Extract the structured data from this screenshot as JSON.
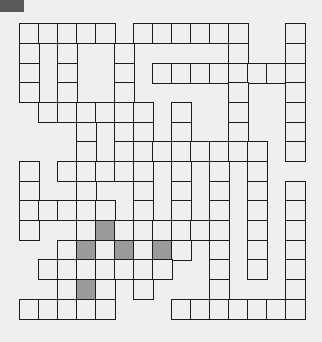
{
  "puzzle": {
    "type": "crossword",
    "rows": 15,
    "cols": 15,
    "legend": {
      "0": "black",
      "1": "white",
      "2": "shaded"
    },
    "colors": {
      "background": "#efefed",
      "line": "#1c1c1c",
      "shaded": "#9a9a9a",
      "corner": "#5a5a5a"
    },
    "grid": [
      [
        1,
        1,
        1,
        1,
        1,
        0,
        1,
        1,
        1,
        1,
        1,
        1,
        0,
        0,
        1
      ],
      [
        1,
        0,
        1,
        0,
        0,
        1,
        0,
        0,
        0,
        0,
        0,
        1,
        0,
        0,
        1
      ],
      [
        1,
        0,
        1,
        0,
        0,
        1,
        0,
        1,
        1,
        1,
        1,
        1,
        1,
        1,
        1
      ],
      [
        1,
        0,
        1,
        0,
        0,
        1,
        0,
        0,
        0,
        0,
        0,
        1,
        0,
        0,
        1
      ],
      [
        0,
        1,
        1,
        1,
        1,
        1,
        1,
        0,
        1,
        0,
        0,
        1,
        0,
        0,
        1
      ],
      [
        0,
        0,
        0,
        1,
        0,
        1,
        1,
        0,
        1,
        0,
        0,
        1,
        0,
        0,
        1
      ],
      [
        0,
        0,
        0,
        1,
        0,
        1,
        1,
        1,
        1,
        1,
        1,
        1,
        1,
        0,
        1
      ],
      [
        1,
        0,
        1,
        1,
        1,
        1,
        1,
        0,
        1,
        0,
        1,
        0,
        1,
        0,
        0
      ],
      [
        1,
        0,
        0,
        1,
        0,
        0,
        1,
        0,
        1,
        0,
        1,
        0,
        1,
        0,
        1
      ],
      [
        1,
        1,
        1,
        1,
        1,
        0,
        1,
        0,
        1,
        0,
        1,
        0,
        1,
        0,
        1
      ],
      [
        1,
        0,
        0,
        1,
        2,
        1,
        1,
        1,
        1,
        1,
        1,
        0,
        1,
        0,
        1
      ],
      [
        0,
        0,
        1,
        2,
        1,
        2,
        1,
        2,
        1,
        0,
        1,
        0,
        1,
        0,
        1
      ],
      [
        0,
        1,
        1,
        1,
        1,
        1,
        1,
        1,
        0,
        0,
        1,
        0,
        1,
        0,
        1
      ],
      [
        0,
        0,
        1,
        2,
        1,
        0,
        1,
        0,
        0,
        0,
        1,
        0,
        0,
        0,
        1
      ],
      [
        1,
        1,
        1,
        1,
        1,
        0,
        0,
        0,
        1,
        1,
        1,
        1,
        1,
        1,
        1
      ]
    ]
  }
}
